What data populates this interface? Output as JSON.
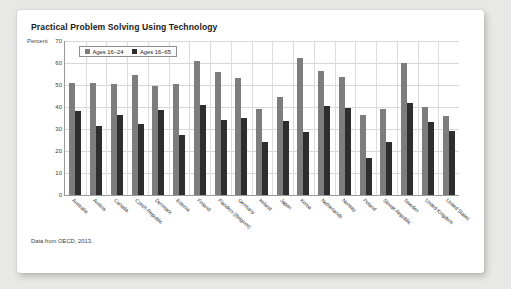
{
  "card": {
    "title": "Practical Problem Solving Using Technology",
    "source_note": "Data from OECD, 2013."
  },
  "chart_data": {
    "type": "bar",
    "title": "Practical Problem Solving Using Technology",
    "xlabel": "",
    "ylabel": "Percent",
    "ylim": [
      0,
      70
    ],
    "yticks": [
      0,
      10,
      20,
      30,
      40,
      50,
      60,
      70
    ],
    "grid": true,
    "legend_position": "top-left",
    "categories": [
      "Australia",
      "Austria",
      "Canada",
      "Czech Republic",
      "Denmark",
      "Estonia",
      "Finland",
      "Flanders (Belgium)",
      "Germany",
      "Ireland",
      "Japan",
      "Korea",
      "Netherlands",
      "Norway",
      "Poland",
      "Slovak Republic",
      "Sweden",
      "United Kingdom",
      "United States"
    ],
    "series": [
      {
        "name": "Ages 16–24",
        "color": "#7d7d7d",
        "values": [
          51,
          51,
          50.5,
          54.5,
          49.5,
          50.5,
          61,
          56,
          53,
          39,
          44.5,
          62.5,
          56.5,
          53.5,
          36.5,
          39,
          60,
          40,
          36
        ]
      },
      {
        "name": "Ages 16–65",
        "color": "#2e2e2e",
        "values": [
          38,
          31.5,
          36.5,
          32.5,
          38.5,
          27.5,
          41,
          34,
          35,
          24,
          33.5,
          28.5,
          40.5,
          39.5,
          17,
          24,
          42,
          33,
          29
        ]
      }
    ]
  }
}
